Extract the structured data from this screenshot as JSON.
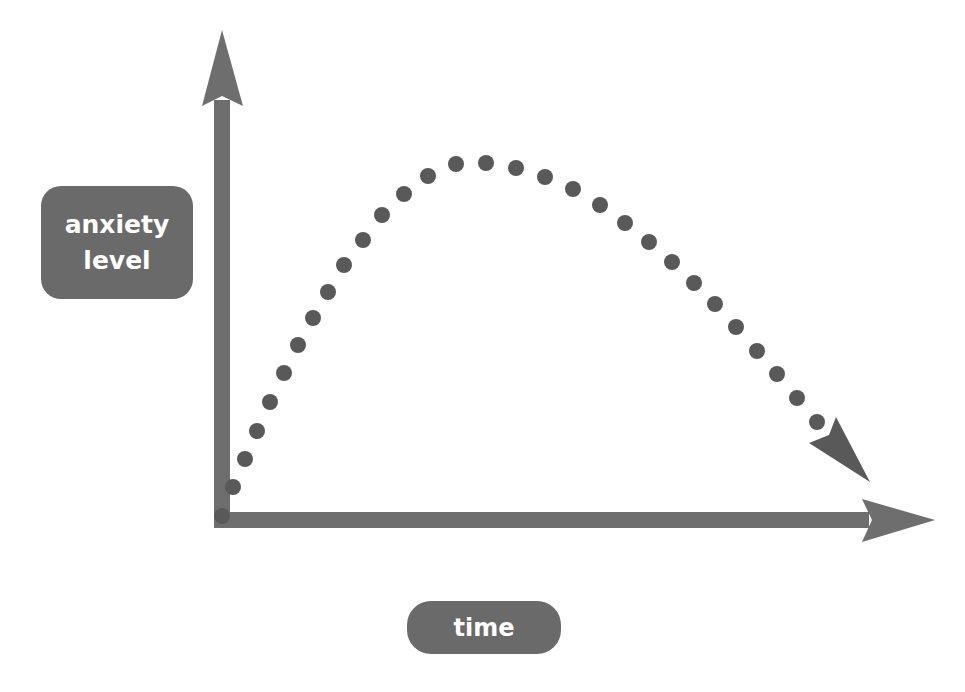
{
  "diagram": {
    "y_axis_label_line1": "anxiety",
    "y_axis_label_line2": "level",
    "x_axis_label": "time",
    "colors": {
      "axis": "#6e6e6e",
      "dots": "#595959",
      "label_box": "#6a6a6a",
      "label_text": "#ffffff",
      "background": "#ffffff"
    },
    "curve_shape": "inverted-U (rise to peak then decline), dotted with arrowhead"
  }
}
